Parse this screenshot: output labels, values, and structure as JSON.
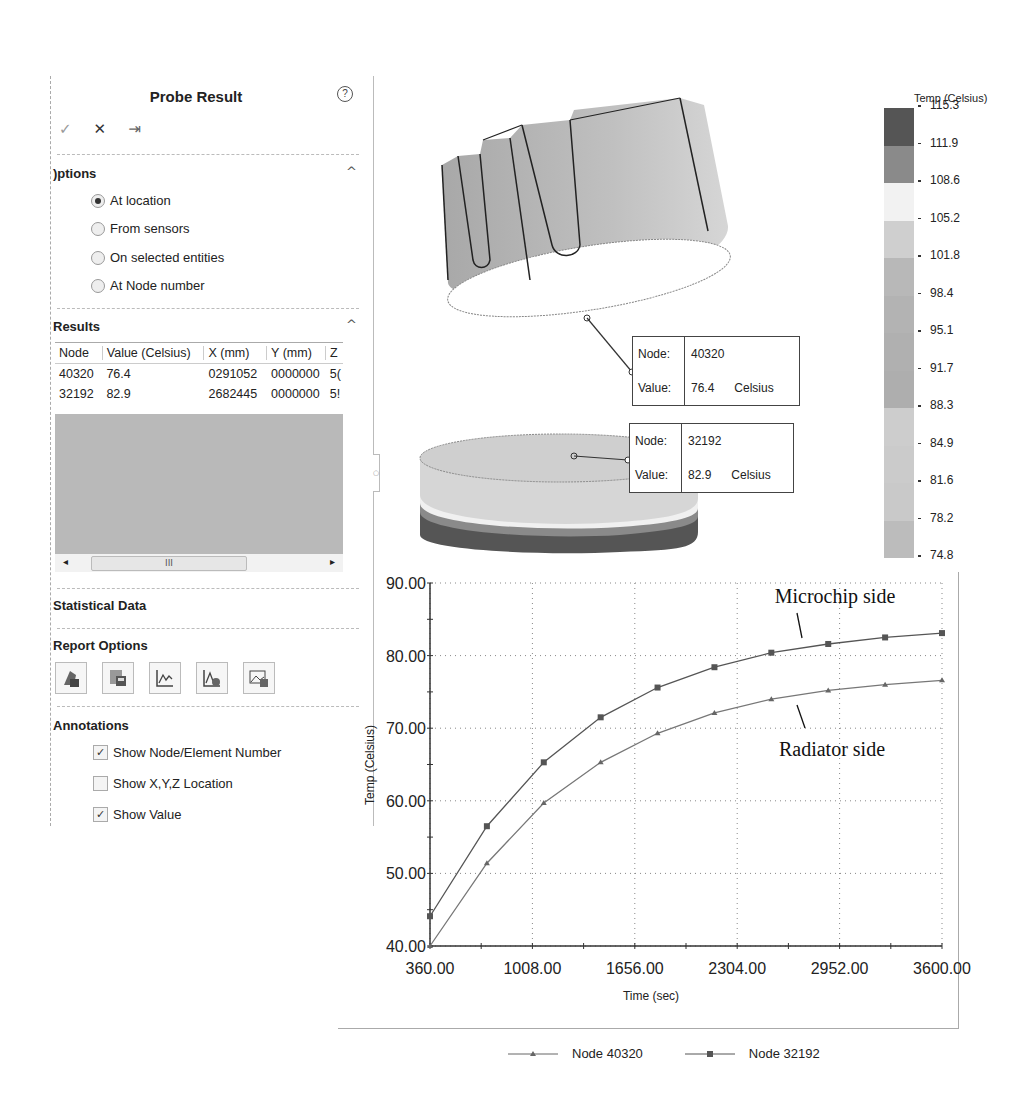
{
  "panel": {
    "title": "Probe Result",
    "help_icon": "question-circle-icon",
    "toolbar": [
      {
        "name": "ok-icon",
        "glyph": "✓"
      },
      {
        "name": "cancel-icon",
        "glyph": "✕"
      },
      {
        "name": "pin-icon",
        "glyph": "⇥"
      }
    ],
    "options": {
      "header": "Options",
      "header_visible": ")ptions",
      "items": [
        {
          "label": "At location",
          "selected": true
        },
        {
          "label": "From sensors",
          "selected": false
        },
        {
          "label": "On selected entities",
          "selected": false
        },
        {
          "label": "At Node number",
          "selected": false
        }
      ]
    },
    "results": {
      "header": "Results",
      "header_visible": "Results",
      "columns": [
        "Node",
        "Value (Celsius)",
        "X (mm)",
        "Y (mm)",
        "Z"
      ],
      "rows": [
        [
          "40320",
          "76.4",
          "0291052",
          "0000000",
          "5("
        ],
        [
          "32192",
          "82.9",
          "2682445",
          "0000000",
          "5!"
        ]
      ],
      "scroll_thumb": "III"
    },
    "statistical_data": {
      "header": "Statistical Data",
      "header_visible": "Statistical Data"
    },
    "report_options": {
      "header": "Report Options",
      "header_visible": "Report Options",
      "buttons": [
        "save-icon",
        "export-csv-icon",
        "plot-icon",
        "save-plot-icon",
        "image-icon"
      ]
    },
    "annotations": {
      "header": "Annotations",
      "header_visible": "Annotations",
      "items": [
        {
          "label": "Show Node/Element Number",
          "checked": true
        },
        {
          "label": "Show X,Y,Z Location",
          "checked": false
        },
        {
          "label": "Show Value",
          "checked": true
        }
      ]
    }
  },
  "viewport": {
    "probes": [
      {
        "node_label": "Node:",
        "node": "40320",
        "value_label": "Value:",
        "value": "76.4",
        "unit": "Celsius"
      },
      {
        "node_label": "Node:",
        "node": "32192",
        "value_label": "Value:",
        "value": "82.9",
        "unit": "Celsius"
      }
    ]
  },
  "legend": {
    "title": "Temp (Celsius)",
    "ticks": [
      "115.3",
      "111.9",
      "108.6",
      "105.2",
      "101.8",
      "98.4",
      "95.1",
      "91.7",
      "88.3",
      "84.9",
      "81.6",
      "78.2",
      "74.8"
    ],
    "colors": [
      "#555555",
      "#8a8a8a",
      "#f2f2f2",
      "#cfcfcf",
      "#b8b8b8",
      "#b3b3b3",
      "#b0b0b0",
      "#aeaeae",
      "#cdcdcd",
      "#cbcbcb",
      "#c9c9c9",
      "#bcbcbc"
    ]
  },
  "chart_data": {
    "type": "line",
    "title": "",
    "xlabel": "Time (sec)",
    "ylabel": "Temp (Celsius)",
    "xlim": [
      360,
      3600
    ],
    "ylim": [
      40,
      90
    ],
    "x_ticks": [
      "360.00",
      "1008.00",
      "1656.00",
      "2304.00",
      "2952.00",
      "3600.00"
    ],
    "y_ticks": [
      "40.00",
      "50.00",
      "60.00",
      "70.00",
      "80.00",
      "90.00"
    ],
    "grid": true,
    "legend_position": "bottom",
    "x": [
      360,
      720,
      1080,
      1440,
      1800,
      2160,
      2520,
      2880,
      3240,
      3600
    ],
    "series": [
      {
        "name": "Node 40320",
        "marker": "triangle",
        "values": [
          40.0,
          51.4,
          59.7,
          65.3,
          69.3,
          72.1,
          74.0,
          75.2,
          76.0,
          76.6
        ]
      },
      {
        "name": "Node 32192",
        "marker": "square",
        "values": [
          44.1,
          56.5,
          65.3,
          71.5,
          75.6,
          78.4,
          80.4,
          81.6,
          82.5,
          83.1
        ]
      }
    ],
    "annotations": [
      "Microchip side",
      "Radiator side"
    ]
  }
}
